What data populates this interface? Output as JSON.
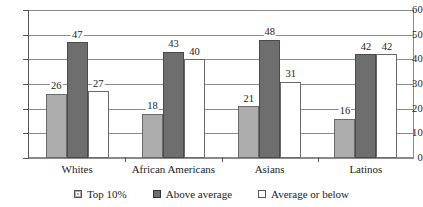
{
  "chart_data": {
    "type": "bar",
    "title": "",
    "subtitle": "",
    "xlabel": "",
    "ylabel": "",
    "ylim": [
      0,
      60
    ],
    "ytick_values": [
      60,
      50,
      40,
      30,
      20,
      10,
      0
    ],
    "ytick_labels": [
      "60",
      "50",
      "40",
      "30",
      "20",
      "10",
      "0"
    ],
    "grid": true,
    "legend_position": "bottom",
    "categories": [
      "Whites",
      "African Americans",
      "Asians",
      "Latinos"
    ],
    "series": [
      {
        "name": "Top 10%",
        "color": "#ADADAD",
        "values": [
          26,
          18,
          21,
          16
        ],
        "labels": [
          "26",
          "18",
          "21",
          "16"
        ]
      },
      {
        "name": "Above average",
        "color": "#6E6E6E",
        "values": [
          47,
          43,
          48,
          42
        ],
        "labels": [
          "47",
          "43",
          "48",
          "42"
        ]
      },
      {
        "name": "Average or below",
        "color": "#FFFFFF",
        "values": [
          27,
          40,
          31,
          42
        ],
        "labels": [
          "27",
          "40",
          "31",
          "42"
        ]
      }
    ]
  },
  "legend": {
    "items": [
      {
        "label": "Top 10%",
        "swatch": "legend-swatch-top-10"
      },
      {
        "label": "Above average",
        "swatch": "legend-swatch-above-average"
      },
      {
        "label": "Average or below",
        "swatch": "legend-swatch-average-or-below"
      }
    ]
  },
  "axes": {
    "y": {
      "ticks": [
        "60",
        "50",
        "40",
        "30",
        "20",
        "10",
        "0"
      ]
    },
    "x": {
      "ticks": [
        "Whites",
        "African Americans",
        "Asians",
        "Latinos"
      ]
    }
  }
}
